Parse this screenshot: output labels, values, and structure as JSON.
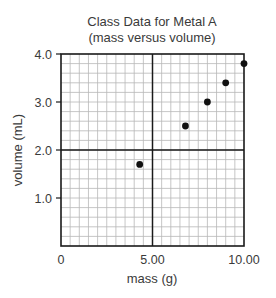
{
  "chart_data": {
    "type": "scatter",
    "title": "Class Data for Metal A",
    "subtitle": "(mass versus volume)",
    "xlabel": "mass (g)",
    "ylabel": "volume (mL)",
    "xlim": [
      0,
      10
    ],
    "ylim": [
      0,
      4
    ],
    "x_ticks": [
      {
        "value": 0,
        "label": "0"
      },
      {
        "value": 5,
        "label": "5.00"
      },
      {
        "value": 10,
        "label": "10.00"
      }
    ],
    "y_ticks": [
      {
        "value": 1,
        "label": "1.0"
      },
      {
        "value": 2,
        "label": "2.0"
      },
      {
        "value": 3,
        "label": "3.0"
      },
      {
        "value": 4,
        "label": "4.0"
      }
    ],
    "grid": true,
    "minor_grid_step": {
      "x": 0.5,
      "y": 0.2
    },
    "major_grid_lines": {
      "x": [
        5
      ],
      "y": [
        2
      ]
    },
    "points": [
      {
        "x": 4.3,
        "y": 1.7
      },
      {
        "x": 6.8,
        "y": 2.5
      },
      {
        "x": 8.0,
        "y": 3.0
      },
      {
        "x": 9.0,
        "y": 3.4
      },
      {
        "x": 10.0,
        "y": 3.8
      }
    ],
    "marker_color": "#111111",
    "grid_color": "#b8b8b8",
    "frame_color": "#1a1a1a"
  }
}
